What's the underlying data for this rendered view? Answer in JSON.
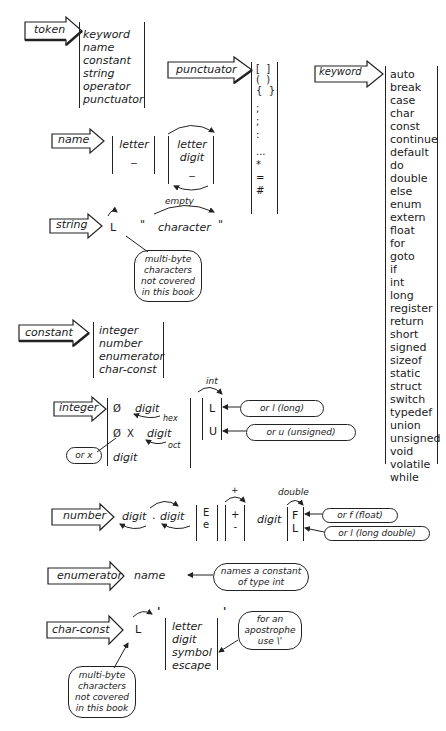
{
  "token": {
    "label": "token",
    "items": [
      "keyword",
      "name",
      "constant",
      "string",
      "operator",
      "punctuator"
    ]
  },
  "punctuator": {
    "label": "punctuator",
    "brackets": [
      "[  ]",
      "(  )",
      "{  }"
    ],
    "items": [
      ";",
      ";",
      ":",
      "...",
      "*",
      "=",
      "#"
    ]
  },
  "keyword": {
    "label": "keyword",
    "items": [
      "auto",
      "break",
      "case",
      "char",
      "const",
      "continue",
      "default",
      "do",
      "double",
      "else",
      "enum",
      "extern",
      "float",
      "for",
      "goto",
      "if",
      "int",
      "long",
      "register",
      "return",
      "short",
      "signed",
      "sizeof",
      "static",
      "struct",
      "switch",
      "typedef",
      "union",
      "unsigned",
      "void",
      "volatile",
      "while"
    ]
  },
  "name": {
    "label": "name",
    "first": [
      "letter",
      "_"
    ],
    "rest": [
      "letter",
      "digit",
      "_"
    ]
  },
  "string": {
    "label": "string",
    "prefix": "L",
    "open_quote": "\"",
    "close_quote": "\"",
    "body": "character",
    "bypass": "empty",
    "note": [
      "multi-byte",
      "characters",
      "not covered",
      "in this book"
    ]
  },
  "constant": {
    "label": "constant",
    "items": [
      "integer",
      "number",
      "enumerator",
      "char-const"
    ]
  },
  "integer": {
    "label": "integer",
    "row1_zero": "Ø",
    "row1_digit": "digit",
    "row1_tag": "hex",
    "row2_zero": "Ø",
    "row2_x": "X",
    "row2_digit": "digit",
    "row2_tag": "oct",
    "row3_digit": "digit",
    "x_note": "or x",
    "int_label": "int",
    "suffix_L": "L",
    "suffix_U": "U",
    "note_long": "or l (long)",
    "note_unsigned": "or u (unsigned)"
  },
  "number": {
    "label": "number",
    "digit1": "digit",
    "dot": ".",
    "digit2": "digit",
    "exp": [
      "E",
      "e"
    ],
    "sign": [
      "+",
      "-"
    ],
    "sign_bypass": "+",
    "exp_digit": "digit",
    "double_label": "double",
    "suffix": [
      "F",
      "L"
    ],
    "note_float": "or f (float)",
    "note_long_double": "or l (long double)"
  },
  "enumerator": {
    "label": "enumerator",
    "item": "name",
    "note": [
      "names a constant",
      "of type int"
    ]
  },
  "char_const": {
    "label": "char-const",
    "prefix": "L",
    "open_quote": "'",
    "close_quote": "'",
    "items": [
      "letter",
      "digit",
      "symbol",
      "escape"
    ],
    "note_apostrophe": [
      "for an",
      "apostrophe",
      "use \\'"
    ],
    "note_multibyte": [
      "multi-byte",
      "characters",
      "not covered",
      "in this book"
    ]
  }
}
